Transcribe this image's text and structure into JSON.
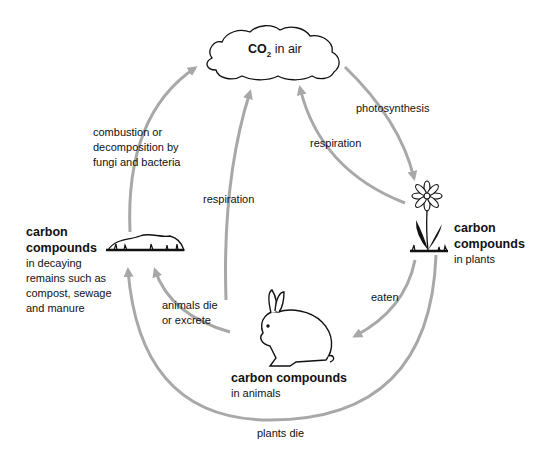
{
  "diagram": {
    "nodes": {
      "air": {
        "formula": "CO",
        "subscript": "2",
        "label": " in air"
      },
      "decay": {
        "title_line1": "carbon",
        "title_line2": "compounds",
        "desc": [
          "in decaying",
          "remains such as",
          "compost, sewage",
          "and manure"
        ]
      },
      "plants": {
        "title_line1": "carbon",
        "title_line2": "compounds",
        "desc": "in plants"
      },
      "animals": {
        "title": "carbon compounds",
        "desc": "in animals"
      }
    },
    "processes": {
      "photosynthesis": "photosynthesis",
      "respiration_plants": "respiration",
      "respiration_animals": "respiration",
      "combustion": [
        "combustion or",
        "decomposition by",
        "fungi and bacteria"
      ],
      "eaten": "eaten",
      "animals_die": [
        "animals die",
        "or excrete"
      ],
      "plants_die": "plants die"
    },
    "colors": {
      "arrow": "#a8a8a8",
      "text": "#111111"
    }
  }
}
